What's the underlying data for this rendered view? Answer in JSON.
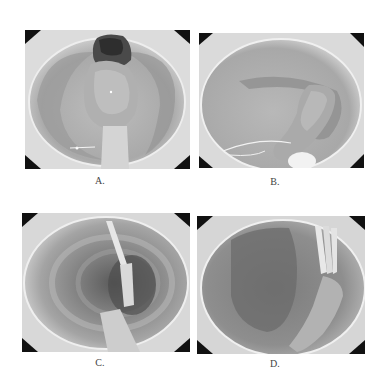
{
  "figure": {
    "panels": [
      {
        "id": "A",
        "label": "A.",
        "description": "endoscopic view of pedunculated polyp with dark head at lumen center"
      },
      {
        "id": "B",
        "label": "B.",
        "description": "endoscopic view of elongated polyp with snare loop around stalk"
      },
      {
        "id": "C",
        "label": "C.",
        "description": "endoscopic view of colonic lumen with instrument and clip inserted"
      },
      {
        "id": "D",
        "label": "D.",
        "description": "endoscopic view of post-resection site with clips applied"
      }
    ],
    "colors": {
      "background": "#ffffff",
      "corner_mask": "#111111",
      "mucosa_light": "#d6d6d6",
      "mucosa_dark": "#8a8a8a"
    }
  }
}
